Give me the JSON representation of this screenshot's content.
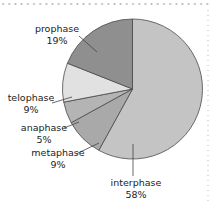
{
  "chart_data": {
    "type": "pie",
    "title": "",
    "categories": [
      "interphase",
      "metaphase",
      "anaphase",
      "telophase",
      "prophase"
    ],
    "values": [
      58,
      9,
      5,
      9,
      19
    ],
    "colors": [
      "#c4c4c4",
      "#a9a9a9",
      "#b4b4b4",
      "#e1e1e1",
      "#8f8f8f"
    ],
    "start_angle": "12 o'clock, clockwise",
    "labels": [
      {
        "name": "interphase",
        "pct": "58%"
      },
      {
        "name": "metaphase",
        "pct": "9%"
      },
      {
        "name": "anaphase",
        "pct": "5%"
      },
      {
        "name": "telophase",
        "pct": "9%"
      },
      {
        "name": "prophase",
        "pct": "19%"
      }
    ],
    "legend": "none (leader-line labels)"
  }
}
